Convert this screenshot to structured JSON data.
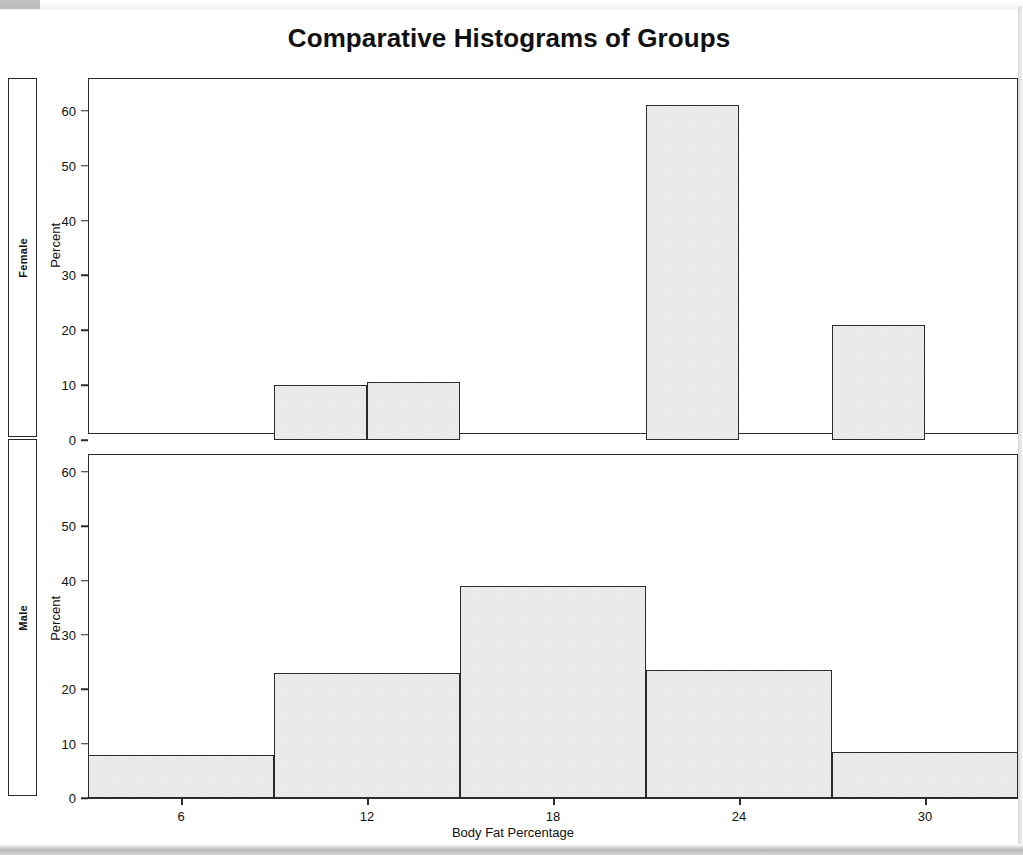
{
  "chart_data": {
    "type": "bar",
    "title": "Comparative Histograms of Groups",
    "xlabel": "Body Fat Percentage",
    "ylabel": "Percent",
    "xlim": [
      3,
      33
    ],
    "ylim": [
      0,
      62
    ],
    "xticks": [
      "6",
      "12",
      "18",
      "24",
      "30"
    ],
    "xtick_values": [
      6,
      12,
      18,
      24,
      30
    ],
    "yticks": [
      "0",
      "10",
      "20",
      "30",
      "40",
      "50",
      "60"
    ],
    "ytick_values": [
      0,
      10,
      20,
      30,
      40,
      50,
      60
    ],
    "grid": false,
    "legend": "none",
    "bin_width": 3,
    "panels": [
      {
        "label": "Female",
        "bins": [
          {
            "start": 9,
            "end": 12,
            "center": 10.5,
            "value": 10.0
          },
          {
            "start": 12,
            "end": 15,
            "center": 13.5,
            "value": 10.5
          },
          {
            "start": 21,
            "end": 24,
            "center": 22.5,
            "value": 61.0
          },
          {
            "start": 27,
            "end": 30,
            "center": 28.5,
            "value": 21.0
          }
        ]
      },
      {
        "label": "Male",
        "bins": [
          {
            "start": 3,
            "end": 9,
            "center": 6.0,
            "value": 8.0
          },
          {
            "start": 9,
            "end": 15,
            "center": 12.0,
            "value": 23.0
          },
          {
            "start": 15,
            "end": 21,
            "center": 18.0,
            "value": 39.0
          },
          {
            "start": 21,
            "end": 27,
            "center": 24.0,
            "value": 23.5
          },
          {
            "start": 27,
            "end": 33,
            "center": 30.0,
            "value": 8.5
          }
        ]
      }
    ]
  },
  "title": "Comparative Histograms of Groups",
  "axis": {
    "x_title": "Body Fat Percentage",
    "y_title": "Percent"
  },
  "panel_labels": {
    "top": "Female",
    "bottom": "Male"
  },
  "yticks": {
    "t0": "0",
    "t10": "10",
    "t20": "20",
    "t30": "30",
    "t40": "40",
    "t50": "50",
    "t60": "60"
  },
  "xticks": {
    "t6": "6",
    "t12": "12",
    "t18": "18",
    "t24": "24",
    "t30": "30"
  },
  "colors": {
    "bar_fill": "#e2e2e2",
    "bar_border": "#2b2b2b",
    "background": "#ffffff",
    "text": "#111111"
  }
}
